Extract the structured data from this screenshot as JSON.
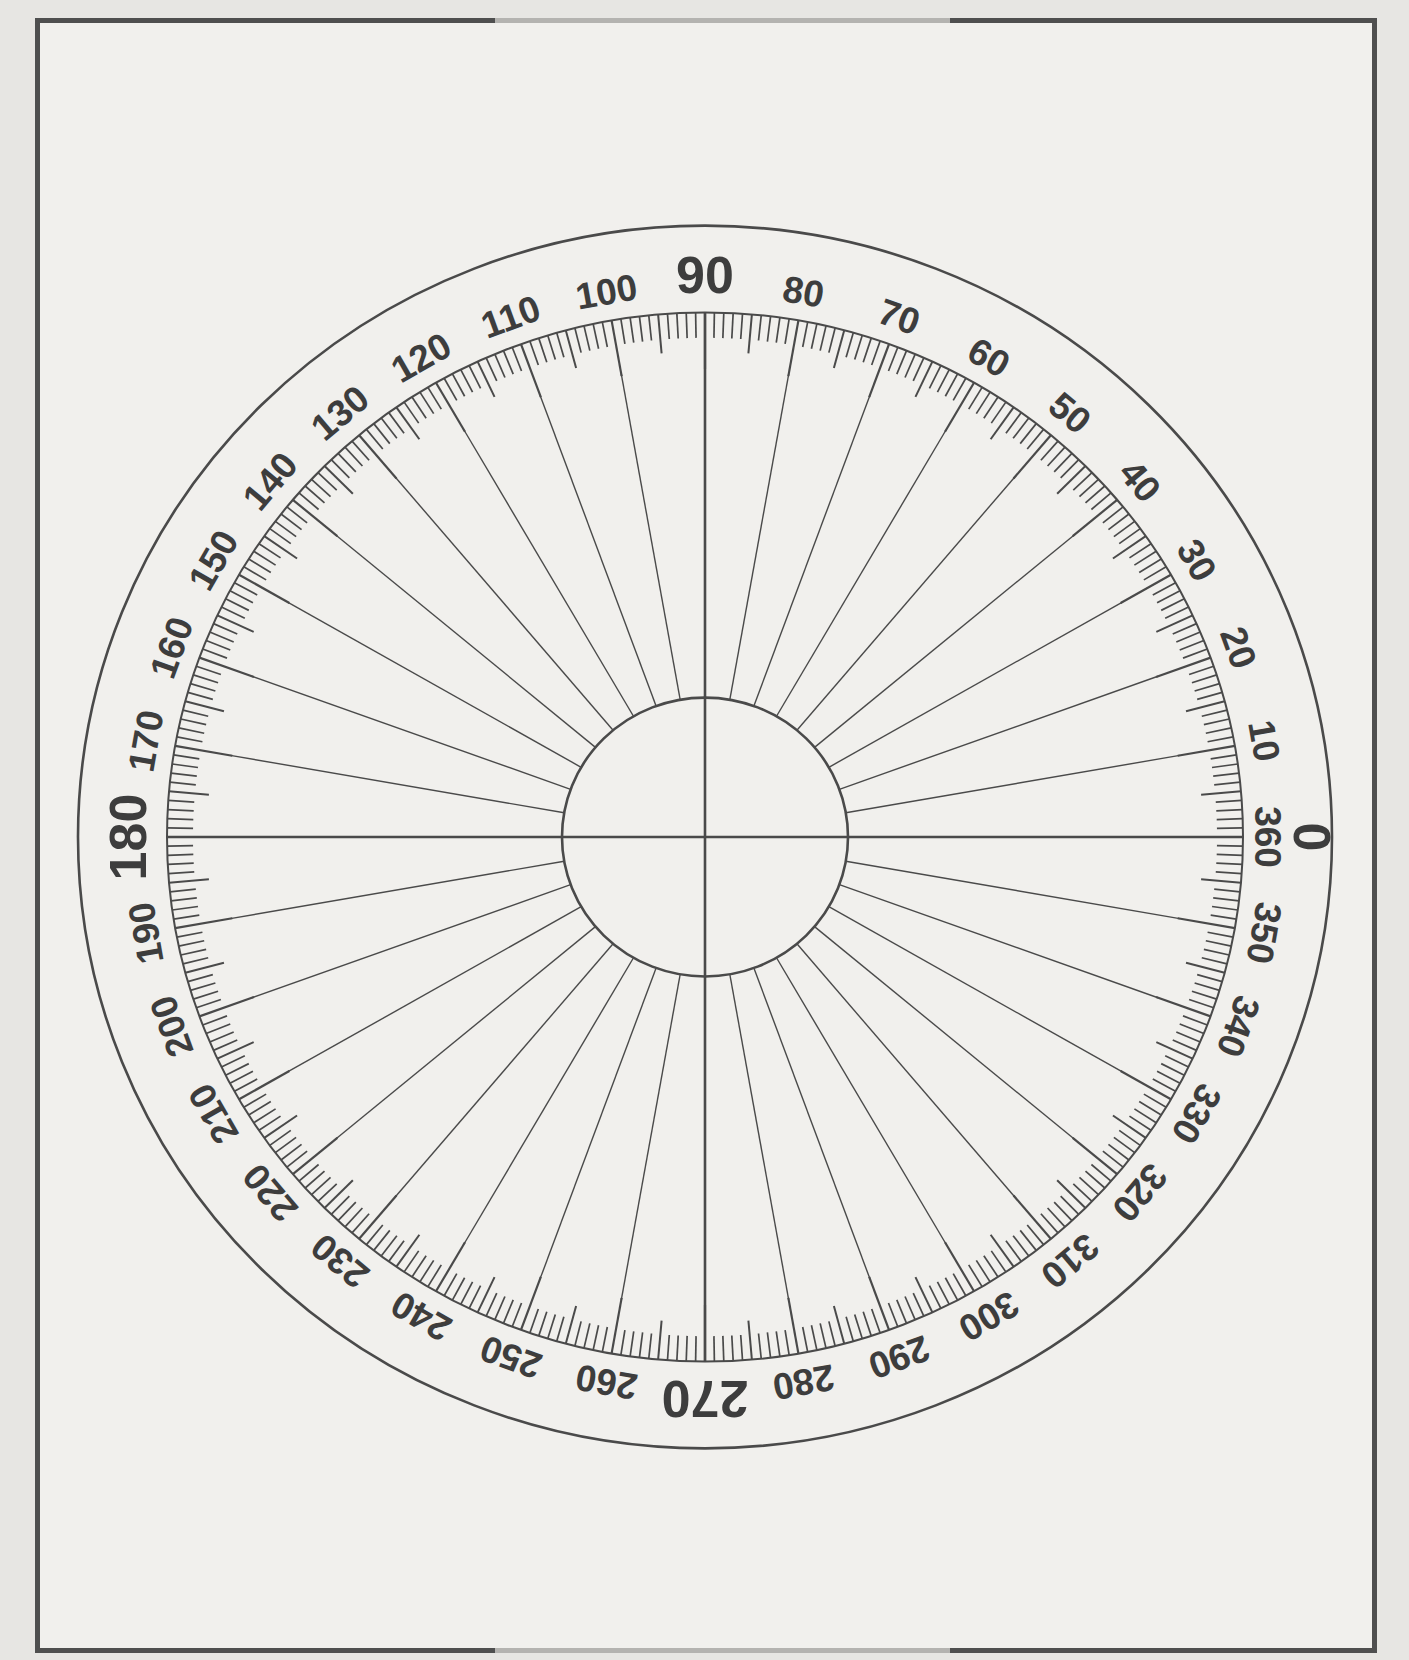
{
  "page": {
    "background_outer": "#e7e6e3",
    "background_inner": "#f1f0ed",
    "frame": {
      "dark_color": "#4f4f4f",
      "light_color": "#b4b3b0"
    }
  },
  "protractor": {
    "kind": "full-circle-protractor",
    "degree_min": 0,
    "degree_max": 360,
    "tick_step_minor_deg": 1,
    "tick_step_medium_deg": 5,
    "tick_step_major_deg": 10,
    "line_color": "#4a4a4a",
    "label_color": "#3d3d3d",
    "major_labels": [
      {
        "text": "0",
        "angle": 0
      },
      {
        "text": "90",
        "angle": 90
      },
      {
        "text": "180",
        "angle": 180
      },
      {
        "text": "270",
        "angle": 270
      }
    ],
    "minor_labels": [
      {
        "text": "10",
        "angle": 10
      },
      {
        "text": "20",
        "angle": 20
      },
      {
        "text": "30",
        "angle": 30
      },
      {
        "text": "40",
        "angle": 40
      },
      {
        "text": "50",
        "angle": 50
      },
      {
        "text": "60",
        "angle": 60
      },
      {
        "text": "70",
        "angle": 70
      },
      {
        "text": "80",
        "angle": 80
      },
      {
        "text": "100",
        "angle": 100
      },
      {
        "text": "110",
        "angle": 110
      },
      {
        "text": "120",
        "angle": 120
      },
      {
        "text": "130",
        "angle": 130
      },
      {
        "text": "140",
        "angle": 140
      },
      {
        "text": "150",
        "angle": 150
      },
      {
        "text": "160",
        "angle": 160
      },
      {
        "text": "170",
        "angle": 170
      },
      {
        "text": "190",
        "angle": 190
      },
      {
        "text": "200",
        "angle": 200
      },
      {
        "text": "210",
        "angle": 210
      },
      {
        "text": "220",
        "angle": 220
      },
      {
        "text": "230",
        "angle": 230
      },
      {
        "text": "240",
        "angle": 240
      },
      {
        "text": "250",
        "angle": 250
      },
      {
        "text": "260",
        "angle": 260
      },
      {
        "text": "280",
        "angle": 280
      },
      {
        "text": "290",
        "angle": 290
      },
      {
        "text": "300",
        "angle": 300
      },
      {
        "text": "310",
        "angle": 310
      },
      {
        "text": "320",
        "angle": 320
      },
      {
        "text": "330",
        "angle": 330
      },
      {
        "text": "340",
        "angle": 340
      },
      {
        "text": "350",
        "angle": 350
      },
      {
        "text": "360",
        "angle": 0
      }
    ]
  }
}
